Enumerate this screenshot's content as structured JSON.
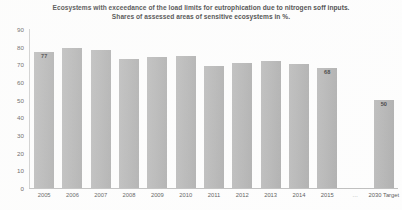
{
  "chart_data": {
    "type": "bar",
    "title": "Ecosystems with exceedance of the load limits for eutrophication due to nitrogen soff inputs.",
    "subtitle": "Shares of assessed areas of sensitive ecosystems in %.",
    "xlabel": "",
    "ylabel": "",
    "ylim": [
      0,
      90
    ],
    "ytick_step": 10,
    "grid": false,
    "legend": "none",
    "bar_color": "#b0b0b0",
    "categories": [
      "2005",
      "2006",
      "2007",
      "2008",
      "2009",
      "2010",
      "2011",
      "2012",
      "2013",
      "2014",
      "2015",
      "…",
      "2030 Target"
    ],
    "values": [
      77,
      79,
      78,
      73,
      74,
      75,
      69,
      71,
      72,
      70,
      68,
      null,
      50
    ],
    "data_labels": [
      "77",
      "",
      "",
      "",
      "",
      "",
      "",
      "",
      "",
      "",
      "68",
      "",
      "50"
    ],
    "yticks": [
      "90",
      "80",
      "70",
      "60",
      "50",
      "40",
      "30",
      "20",
      "10",
      "0"
    ],
    "series": [
      {
        "name": "Share of assessed areas of sensitive ecosystems exceeding load limits (%)",
        "values": [
          77,
          79,
          78,
          73,
          74,
          75,
          69,
          71,
          72,
          70,
          68,
          null,
          50
        ]
      }
    ]
  }
}
